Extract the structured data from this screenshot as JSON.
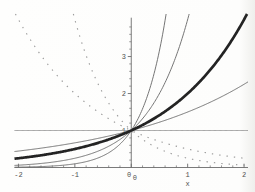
{
  "figure": {
    "xlabel": "x"
  },
  "chart_data": {
    "type": "line",
    "title": "",
    "xlabel": "x",
    "ylabel": "",
    "xlim": [
      -2.07,
      2.07
    ],
    "ylim": [
      0,
      4.15
    ],
    "grid": false,
    "legend": "none",
    "x_ticks": {
      "major": [
        -2,
        -1,
        0,
        1,
        2
      ],
      "labels": [
        "-2",
        "-1",
        "0",
        "1",
        "2"
      ],
      "minor_step": 0.2
    },
    "y_ticks": {
      "major": [
        1,
        2,
        3
      ],
      "labels": [
        "1",
        "2",
        "3"
      ],
      "minor_step": 0.2,
      "axis_top": 4.05
    },
    "origin_labels": [
      "0",
      "0"
    ],
    "series": [
      {
        "name": "y = 10^x",
        "base": 10,
        "style": "solid",
        "role": "thin"
      },
      {
        "name": "y = 4^x",
        "base": 4,
        "style": "solid",
        "role": "thin"
      },
      {
        "name": "y = 1.5^x",
        "base": 1.5,
        "style": "solid",
        "role": "thin"
      },
      {
        "name": "y = 1^x",
        "base": 1,
        "style": "solid",
        "role": "hairline"
      },
      {
        "name": "y = 2^x",
        "base": 2,
        "style": "solid",
        "role": "bold"
      },
      {
        "name": "y = (1/2)^x",
        "base": 0.5,
        "style": "dotted",
        "role": "dotted"
      },
      {
        "name": "y = (1/4)^x",
        "base": 0.25,
        "style": "dotted",
        "role": "dotted"
      }
    ],
    "colors": {
      "thin": "#6e6e6e",
      "bold": "#232323",
      "hairline": "#8c8c8c",
      "dotted": "#9d9d9d",
      "axis": "#6b6b6b",
      "label": "#4f4f4f",
      "background": "#fdfdfc"
    }
  }
}
